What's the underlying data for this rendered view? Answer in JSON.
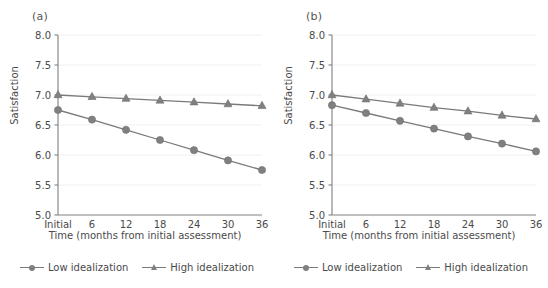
{
  "figure": {
    "panels": [
      {
        "label": "(a)",
        "xlabel": "Time (months from initial assessment)",
        "ylabel": "Satisfaction"
      },
      {
        "label": "(b)",
        "xlabel": "Time (months from initial assessment)",
        "ylabel": "Satisfaction"
      }
    ],
    "legend": {
      "entries": [
        {
          "label": "Low idealization",
          "marker": "circle",
          "color": "#808080"
        },
        {
          "label": "High idealization",
          "marker": "triangle",
          "color": "#808080"
        }
      ]
    },
    "colors": {
      "line": "#7a7a7a",
      "marker": "#808080",
      "axis": "#8a8a8a",
      "grid": "#f0f0f0",
      "text": "#4a4a4a",
      "background": "#ffffff"
    }
  },
  "chart_data": [
    {
      "type": "line",
      "title": "(a)",
      "xlabel": "Time (months from initial assessment)",
      "ylabel": "Satisfaction",
      "categories": [
        "Initial",
        "6",
        "12",
        "18",
        "24",
        "30",
        "36"
      ],
      "x_tick_labels": [
        "Initial",
        "6",
        "12",
        "18",
        "24",
        "30",
        "36"
      ],
      "y_tick_labels": [
        "5.0",
        "5.5",
        "6.0",
        "6.5",
        "7.0",
        "7.5",
        "8.0"
      ],
      "ylim": [
        5.0,
        8.0
      ],
      "y_ticks": [
        5.0,
        5.5,
        6.0,
        6.5,
        7.0,
        7.5,
        8.0
      ],
      "grid": true,
      "legend_position": "bottom",
      "series": [
        {
          "name": "Low idealization",
          "marker": "circle",
          "values": [
            6.75,
            6.59,
            6.42,
            6.25,
            6.08,
            5.91,
            5.75
          ]
        },
        {
          "name": "High idealization",
          "marker": "triangle",
          "values": [
            7.0,
            6.97,
            6.94,
            6.91,
            6.88,
            6.85,
            6.82
          ]
        }
      ]
    },
    {
      "type": "line",
      "title": "(b)",
      "xlabel": "Time (months from initial assessment)",
      "ylabel": "Satisfaction",
      "categories": [
        "Initial",
        "6",
        "12",
        "18",
        "24",
        "30",
        "36"
      ],
      "x_tick_labels": [
        "Initial",
        "6",
        "12",
        "18",
        "24",
        "30",
        "36"
      ],
      "y_tick_labels": [
        "5.0",
        "5.5",
        "6.0",
        "6.5",
        "7.0",
        "7.5",
        "8.0"
      ],
      "ylim": [
        5.0,
        8.0
      ],
      "y_ticks": [
        5.0,
        5.5,
        6.0,
        6.5,
        7.0,
        7.5,
        8.0
      ],
      "grid": true,
      "legend_position": "bottom",
      "series": [
        {
          "name": "Low idealization",
          "marker": "circle",
          "values": [
            6.83,
            6.7,
            6.57,
            6.44,
            6.31,
            6.19,
            6.06
          ]
        },
        {
          "name": "High idealization",
          "marker": "triangle",
          "values": [
            7.0,
            6.93,
            6.86,
            6.79,
            6.73,
            6.66,
            6.6
          ]
        }
      ]
    }
  ]
}
